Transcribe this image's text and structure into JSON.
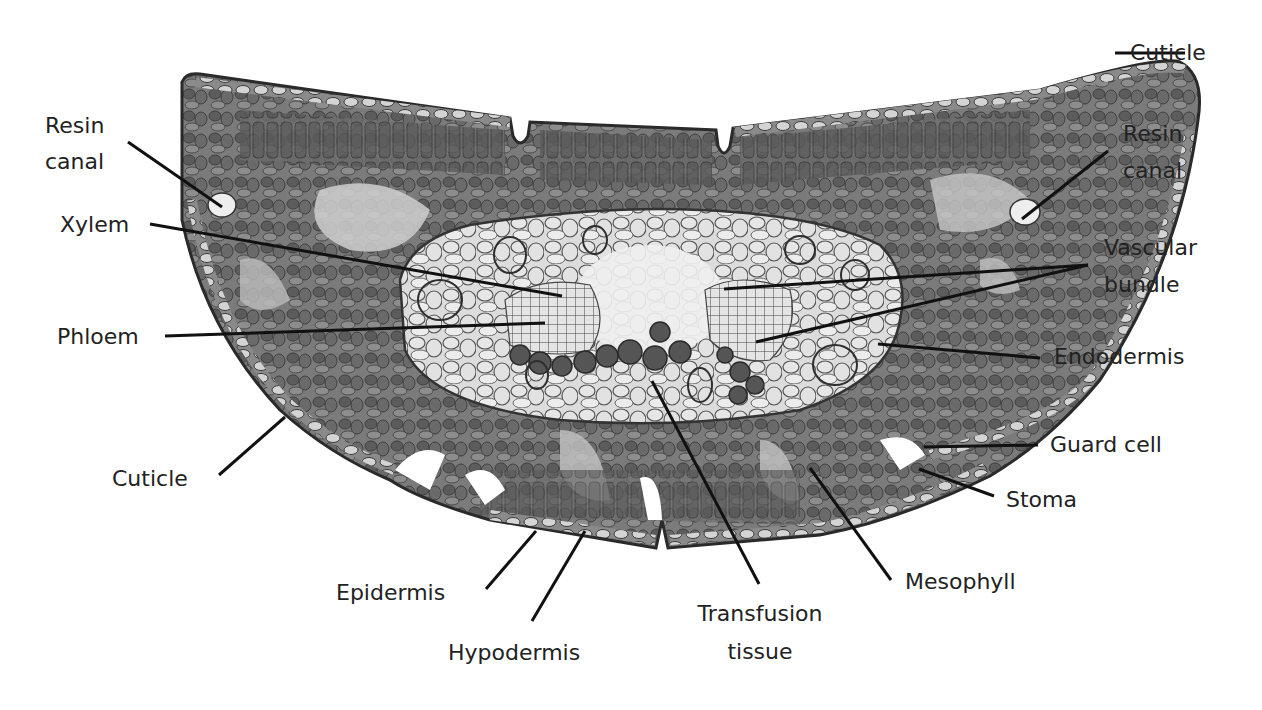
{
  "diagram": {
    "colors": {
      "background": "#ffffff",
      "tissue_dark": "#5a5a5a",
      "tissue_mid": "#8a8a8a",
      "tissue_light": "#d8d8d8",
      "outline": "#2a2a2a",
      "leader_line": "#111111",
      "label_text": "#222222"
    },
    "labels": {
      "cuticle_top": "Cuticle",
      "resin_canal_left_1": "Resin",
      "resin_canal_left_2": "canal",
      "resin_canal_right_1": "Resin",
      "resin_canal_right_2": "canal",
      "xylem": "Xylem",
      "phloem": "Phloem",
      "vascular_bundle_1": "Vascular",
      "vascular_bundle_2": "bundle",
      "endodermis": "Endodermis",
      "guard_cell": "Guard cell",
      "stoma": "Stoma",
      "cuticle_bottom": "Cuticle",
      "epidermis": "Epidermis",
      "hypodermis": "Hypodermis",
      "transfusion_tissue_1": "Transfusion",
      "transfusion_tissue_2": "tissue",
      "mesophyll": "Mesophyll"
    }
  }
}
